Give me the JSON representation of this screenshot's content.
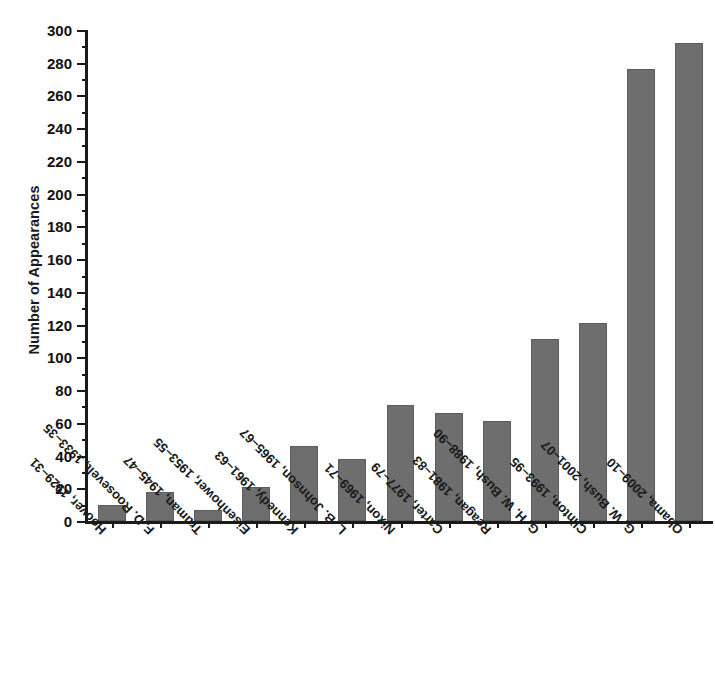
{
  "chart_data": {
    "type": "bar",
    "title": "",
    "xlabel": "",
    "ylabel": "Number of Appearances",
    "ylim": [
      0,
      300
    ],
    "ytick_step": 20,
    "yminor_step": 10,
    "grid": false,
    "legend": null,
    "bar_color": "#6e6e6e",
    "axis_color": "#1a1a1a",
    "background": "#ffffff",
    "categories": [
      "Hoover, 1929–31",
      "F. D. Roosevelt, 1933–35",
      "Truman, 1945–47",
      "Eisenhower, 1953–55",
      "Kennedy, 1961–63",
      "L. B. Johnson, 1965–67",
      "Nixon, 1969–71",
      "Carter, 1977–79",
      "Reagan, 1981–83",
      "G. H. W. Bush, 1988–90",
      "Clinton, 1993–95",
      "G. W. Bush, 2001–07",
      "Obama, 2009–10"
    ],
    "values": [
      10,
      18,
      7,
      21,
      46,
      38,
      71,
      66,
      61,
      111,
      121,
      276,
      292
    ],
    "ytick_labels": [
      "0",
      "20",
      "40",
      "60",
      "80",
      "100",
      "120",
      "140",
      "160",
      "180",
      "200",
      "220",
      "240",
      "260",
      "280",
      "300"
    ],
    "ytick_values": [
      0,
      20,
      40,
      60,
      80,
      100,
      120,
      140,
      160,
      180,
      200,
      220,
      240,
      260,
      280,
      300
    ]
  }
}
